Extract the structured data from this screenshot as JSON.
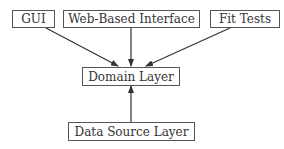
{
  "diagram": {
    "type": "layered-architecture",
    "nodes": {
      "gui": {
        "label": "GUI"
      },
      "web": {
        "label": "Web-Based Interface"
      },
      "fit": {
        "label": "Fit Tests"
      },
      "domain": {
        "label": "Domain Layer"
      },
      "datasource": {
        "label": "Data Source Layer"
      }
    },
    "edges": [
      {
        "from": "GUI",
        "to": "Domain Layer"
      },
      {
        "from": "Web-Based Interface",
        "to": "Domain Layer"
      },
      {
        "from": "Fit Tests",
        "to": "Domain Layer"
      },
      {
        "from": "Data Source Layer",
        "to": "Domain Layer"
      }
    ],
    "colors": {
      "line": "#333333",
      "border": "#555555",
      "text": "#333333"
    }
  }
}
